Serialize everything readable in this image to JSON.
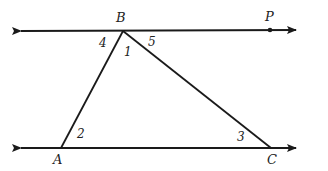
{
  "diagram": {
    "type": "geometry",
    "colors": {
      "stroke": "#1a1a1a",
      "text": "#222222",
      "background": "#ffffff"
    },
    "points": {
      "B": {
        "label": "B",
        "x": 123,
        "y": 31,
        "label_x": 116,
        "label_y": 22
      },
      "P": {
        "label": "P",
        "x": 270,
        "y": 30,
        "label_x": 265,
        "label_y": 21
      },
      "A": {
        "label": "A",
        "x": 61,
        "y": 148,
        "label_x": 53,
        "label_y": 164
      },
      "C": {
        "label": "C",
        "x": 271,
        "y": 148,
        "label_x": 267,
        "label_y": 164
      }
    },
    "lines": [
      {
        "name": "top-line-BP",
        "x1": 21,
        "y1": 31,
        "x2": 296,
        "y2": 30,
        "arrows": "both"
      },
      {
        "name": "bottom-line-AC",
        "x1": 21,
        "y1": 148,
        "x2": 296,
        "y2": 148,
        "arrows": "both"
      }
    ],
    "segments": [
      {
        "name": "segment-AB",
        "from": "A",
        "to": "B"
      },
      {
        "name": "segment-BC",
        "from": "B",
        "to": "C"
      }
    ],
    "angles": [
      {
        "label": "4",
        "x": 99,
        "y": 47
      },
      {
        "label": "1",
        "x": 124,
        "y": 56
      },
      {
        "label": "5",
        "x": 148,
        "y": 46
      },
      {
        "label": "2",
        "x": 77,
        "y": 138
      },
      {
        "label": "3",
        "x": 237,
        "y": 141
      }
    ]
  }
}
